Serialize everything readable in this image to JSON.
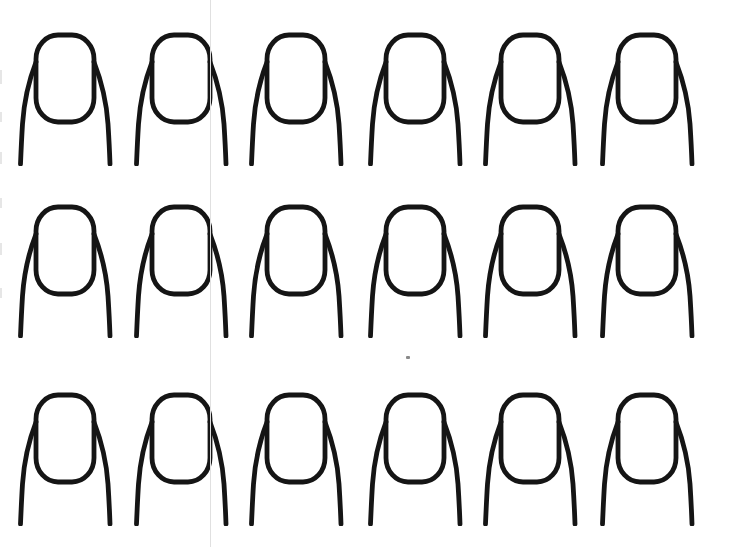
{
  "sheet": {
    "description": "Blank fingernail practice template sheet, 3 rows of 6 nail outlines",
    "width": 735,
    "height": 547,
    "background_color": "#ffffff"
  },
  "template": {
    "grid": {
      "rows": 3,
      "columns": 6,
      "row_tops": [
        32,
        204,
        392
      ],
      "column_lefts": [
        10,
        126,
        241,
        360,
        475,
        592
      ],
      "cell_width": 122,
      "cell_height": 134
    },
    "nail": {
      "stroke_color": "#151515",
      "stroke_width": 4.8,
      "plate": {
        "x": 26,
        "y": 3,
        "width": 58,
        "height": 87,
        "rx": 22,
        "ry": 24
      },
      "left_side_path": "M 26 30 C 19 48 14 70 12.5 92 C 11.5 108 11 120 10.5 132",
      "right_side_path": "M 84 30 C 91 48 96.5 70 98 92 C 99 108 99.6 120 100 132"
    }
  },
  "artifacts": {
    "seam_line": {
      "x": 210,
      "width": 1,
      "color": "#e0e0e0"
    },
    "speck": {
      "x": 406,
      "y": 356,
      "width": 4,
      "height": 3,
      "color": "#8a8a8a"
    },
    "edge_smudge_color": "#e6e6e6",
    "edge_smudges": [
      {
        "y": 70,
        "height": 14
      },
      {
        "y": 112,
        "height": 10
      },
      {
        "y": 152,
        "height": 12
      },
      {
        "y": 198,
        "height": 10
      },
      {
        "y": 243,
        "height": 12
      },
      {
        "y": 288,
        "height": 10
      }
    ]
  }
}
